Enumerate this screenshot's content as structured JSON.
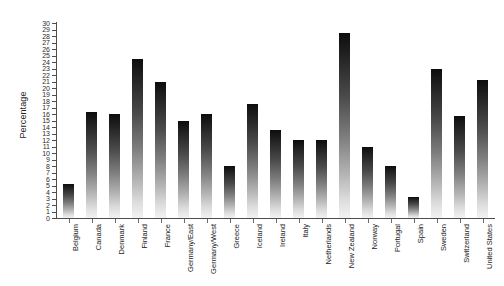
{
  "chart_data": {
    "type": "bar",
    "title": "",
    "xlabel": "",
    "ylabel": "Percentage",
    "ylim": [
      0,
      30
    ],
    "ytick_step": 1,
    "grid": false,
    "legend": false,
    "orientation": "vertical",
    "bar_style": "vertical-gradient-dark-top-to-light-bottom",
    "categories": [
      "Belgium",
      "Canada",
      "Denmark",
      "Finland",
      "France",
      "Germany/East",
      "Germany/West",
      "Greece",
      "Iceland",
      "Ireland",
      "Italy",
      "Netherlands",
      "New Zealand",
      "Norway",
      "Portugal",
      "Spain",
      "Sweden",
      "Switzerland",
      "United States"
    ],
    "values": [
      5.3,
      16.3,
      16.0,
      24.5,
      21.0,
      15.0,
      16.0,
      8.0,
      17.5,
      13.5,
      12.0,
      12.0,
      28.5,
      11.0,
      8.0,
      3.2,
      23.0,
      15.7,
      21.2
    ],
    "ytick_labels": [
      "0",
      "1",
      "2",
      "3",
      "4",
      "5",
      "6",
      "7",
      "8",
      "9",
      "10",
      "11",
      "12",
      "13",
      "14",
      "15",
      "16",
      "17",
      "18",
      "19",
      "20",
      "21",
      "22",
      "23",
      "24",
      "25",
      "26",
      "27",
      "28",
      "29",
      "30"
    ]
  },
  "axes": {
    "y_label": "Percentage"
  },
  "colors": {
    "bar_top": "#0d0d0d",
    "bar_bottom": "#f2f2f2",
    "axis": "#4d4d4d",
    "text": "#1a1a1a",
    "background": "#ffffff"
  }
}
